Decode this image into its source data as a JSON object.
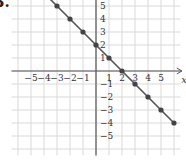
{
  "problem": {
    "number": "3."
  },
  "chart_data": {
    "type": "line",
    "title": "",
    "xlabel": "x",
    "ylabel": "y",
    "xlim": [
      -6,
      6.5
    ],
    "ylim": [
      -6,
      6.5
    ],
    "grid": true,
    "legend": null,
    "x_ticks": [
      "-5",
      "-4",
      "-3",
      "-2",
      "-1",
      "1",
      "2",
      "3",
      "4",
      "5"
    ],
    "y_ticks": [
      "5",
      "4",
      "3",
      "2",
      "1",
      "-1",
      "-2",
      "-3",
      "-4",
      "-5"
    ],
    "series": [
      {
        "name": "y = -x + 2",
        "x": [
          -4,
          -3,
          -2,
          -1,
          0,
          1,
          2,
          3,
          4,
          5,
          6
        ],
        "y": [
          6,
          5,
          4,
          3,
          2,
          1,
          0,
          -1,
          -2,
          -3,
          -4
        ]
      }
    ],
    "colors": {
      "line": "#555555",
      "point": "#444444",
      "grid": "#d9d9d9",
      "axis": "#555555",
      "text": "#333333"
    }
  }
}
